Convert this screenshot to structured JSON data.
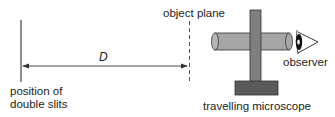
{
  "diagram": {
    "labels": {
      "slits": [
        "position of",
        "double slits"
      ],
      "distance": "D",
      "object_plane": "object plane",
      "observer": "observer",
      "microscope": "travelling microscope"
    },
    "colors": {
      "line": "#333333",
      "tube_fill": "#a6a6a6",
      "post_fill": "#7f7f7f",
      "base_fill": "#5a5a5a",
      "outline": "#333333"
    }
  }
}
